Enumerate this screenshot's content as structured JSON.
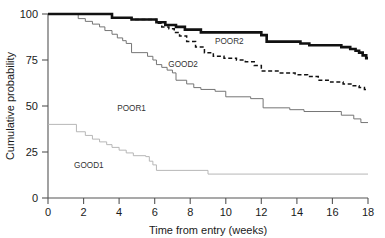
{
  "chart_data": {
    "type": "line",
    "title": "",
    "subtitle": "",
    "xlabel": "Time from entry (weeks)",
    "ylabel": "Cumulative probability",
    "xlim": [
      0,
      18
    ],
    "ylim": [
      0,
      100
    ],
    "xticks": [
      0,
      2,
      4,
      6,
      8,
      10,
      12,
      14,
      16,
      18
    ],
    "yticks": [
      0,
      25,
      50,
      75,
      100
    ],
    "xtick_labels": [
      "0",
      "2",
      "4",
      "6",
      "8",
      "10",
      "12",
      "14",
      "16",
      "18"
    ],
    "ytick_labels": [
      "0",
      "25",
      "50",
      "75",
      "100"
    ],
    "grid": false,
    "legend_position": "inline-annotations",
    "style": "kaplan-meier step curves",
    "annotations": [
      {
        "text": "POOR2",
        "x": 10.2,
        "y": 83.5
      },
      {
        "text": "GOOD2",
        "x": 7.6,
        "y": 71.0
      },
      {
        "text": "POOR1",
        "x": 4.7,
        "y": 47.5
      },
      {
        "text": "GOOD1",
        "x": 2.3,
        "y": 16.5
      }
    ],
    "series": [
      {
        "name": "POOR2",
        "style": "solid",
        "line_width": "bold",
        "color": "#111111",
        "start_value": 100,
        "end_value": 76,
        "points": [
          [
            0,
            100
          ],
          [
            3.6,
            100
          ],
          [
            3.6,
            98
          ],
          [
            4.7,
            98
          ],
          [
            4.7,
            97
          ],
          [
            6.1,
            97
          ],
          [
            6.1,
            95.5
          ],
          [
            6.6,
            95.5
          ],
          [
            6.6,
            94
          ],
          [
            7.2,
            94
          ],
          [
            7.2,
            93
          ],
          [
            7.7,
            93
          ],
          [
            7.7,
            91.5
          ],
          [
            8.6,
            91.5
          ],
          [
            8.6,
            90
          ],
          [
            12.0,
            90
          ],
          [
            12.0,
            88.5
          ],
          [
            12.3,
            88.5
          ],
          [
            12.3,
            85
          ],
          [
            14.2,
            85
          ],
          [
            14.2,
            84
          ],
          [
            14.7,
            84
          ],
          [
            14.7,
            83
          ],
          [
            16.5,
            83
          ],
          [
            16.5,
            82
          ],
          [
            17.0,
            82
          ],
          [
            17.0,
            81
          ],
          [
            17.3,
            81
          ],
          [
            17.3,
            80
          ],
          [
            17.5,
            80
          ],
          [
            17.5,
            79
          ],
          [
            17.7,
            79
          ],
          [
            17.7,
            77.5
          ],
          [
            17.9,
            77.5
          ],
          [
            17.9,
            76
          ],
          [
            18.0,
            76
          ]
        ]
      },
      {
        "name": "GOOD2",
        "style": "dotted",
        "line_width": "medium",
        "color": "#111111",
        "start_value": 100,
        "end_value": 59,
        "points": [
          [
            0,
            100
          ],
          [
            3.6,
            100
          ],
          [
            3.6,
            98
          ],
          [
            4.7,
            98
          ],
          [
            4.7,
            97
          ],
          [
            6.1,
            97
          ],
          [
            6.1,
            95
          ],
          [
            6.4,
            95
          ],
          [
            6.4,
            93
          ],
          [
            6.8,
            93
          ],
          [
            6.8,
            92
          ],
          [
            7.1,
            92
          ],
          [
            7.1,
            90
          ],
          [
            7.4,
            90
          ],
          [
            7.4,
            88
          ],
          [
            7.8,
            88
          ],
          [
            7.8,
            85
          ],
          [
            8.3,
            85
          ],
          [
            8.3,
            82
          ],
          [
            8.8,
            82
          ],
          [
            8.8,
            79
          ],
          [
            9.3,
            79
          ],
          [
            9.3,
            77
          ],
          [
            9.9,
            77
          ],
          [
            9.9,
            76
          ],
          [
            10.6,
            76
          ],
          [
            10.6,
            75
          ],
          [
            11.1,
            75
          ],
          [
            11.1,
            74
          ],
          [
            11.6,
            74
          ],
          [
            11.6,
            72
          ],
          [
            12.0,
            72
          ],
          [
            12.0,
            69
          ],
          [
            13.0,
            69
          ],
          [
            13.0,
            68
          ],
          [
            13.9,
            68
          ],
          [
            13.9,
            67
          ],
          [
            14.6,
            67
          ],
          [
            14.6,
            66
          ],
          [
            15.2,
            66
          ],
          [
            15.2,
            64
          ],
          [
            15.9,
            64
          ],
          [
            15.9,
            63
          ],
          [
            16.6,
            63
          ],
          [
            16.6,
            62
          ],
          [
            17.1,
            62
          ],
          [
            17.1,
            61
          ],
          [
            17.5,
            61
          ],
          [
            17.5,
            60
          ],
          [
            17.8,
            60
          ],
          [
            17.8,
            59
          ],
          [
            18.0,
            59
          ]
        ]
      },
      {
        "name": "POOR1",
        "style": "solid",
        "line_width": "thin",
        "color": "#6e6e6e",
        "start_value": 100,
        "end_value": 41,
        "points": [
          [
            0,
            100
          ],
          [
            1.7,
            100
          ],
          [
            1.7,
            97.5
          ],
          [
            2.1,
            97.5
          ],
          [
            2.1,
            96
          ],
          [
            2.5,
            96
          ],
          [
            2.5,
            94.5
          ],
          [
            2.9,
            94.5
          ],
          [
            2.9,
            93
          ],
          [
            3.2,
            93
          ],
          [
            3.2,
            91
          ],
          [
            3.6,
            91
          ],
          [
            3.6,
            89
          ],
          [
            3.9,
            89
          ],
          [
            3.9,
            87
          ],
          [
            4.2,
            87
          ],
          [
            4.2,
            85.5
          ],
          [
            4.4,
            85.5
          ],
          [
            4.4,
            84
          ],
          [
            4.7,
            84
          ],
          [
            4.7,
            79
          ],
          [
            5.6,
            79
          ],
          [
            5.6,
            77
          ],
          [
            5.9,
            77
          ],
          [
            5.9,
            75
          ],
          [
            6.1,
            75
          ],
          [
            6.1,
            72.5
          ],
          [
            6.4,
            72.5
          ],
          [
            6.4,
            71
          ],
          [
            6.7,
            71
          ],
          [
            6.7,
            69.5
          ],
          [
            7.0,
            69.5
          ],
          [
            7.0,
            68
          ],
          [
            7.2,
            68
          ],
          [
            7.2,
            64
          ],
          [
            7.8,
            64
          ],
          [
            7.8,
            62
          ],
          [
            8.2,
            62
          ],
          [
            8.2,
            60
          ],
          [
            8.6,
            60
          ],
          [
            8.6,
            59
          ],
          [
            9.4,
            59
          ],
          [
            9.4,
            58
          ],
          [
            10.0,
            58
          ],
          [
            10.0,
            55
          ],
          [
            11.4,
            55
          ],
          [
            11.4,
            54
          ],
          [
            12.1,
            54
          ],
          [
            12.1,
            49
          ],
          [
            13.6,
            49
          ],
          [
            13.6,
            48
          ],
          [
            14.4,
            48
          ],
          [
            14.4,
            47
          ],
          [
            16.5,
            47
          ],
          [
            16.5,
            45
          ],
          [
            17.2,
            45
          ],
          [
            17.2,
            43
          ],
          [
            17.6,
            43
          ],
          [
            17.6,
            41
          ],
          [
            18.0,
            41
          ]
        ]
      },
      {
        "name": "GOOD1",
        "style": "solid",
        "line_width": "thin",
        "color": "#b3b3b3",
        "start_value": 40,
        "end_value": 13,
        "points": [
          [
            0,
            40
          ],
          [
            1.6,
            40
          ],
          [
            1.6,
            36
          ],
          [
            2.1,
            36
          ],
          [
            2.1,
            34
          ],
          [
            2.5,
            34
          ],
          [
            2.5,
            32
          ],
          [
            2.9,
            32
          ],
          [
            2.9,
            30.5
          ],
          [
            3.3,
            30.5
          ],
          [
            3.3,
            29
          ],
          [
            3.6,
            29
          ],
          [
            3.6,
            27.5
          ],
          [
            4.0,
            27.5
          ],
          [
            4.0,
            26
          ],
          [
            4.4,
            26
          ],
          [
            4.4,
            24.5
          ],
          [
            4.8,
            24.5
          ],
          [
            4.8,
            23
          ],
          [
            5.5,
            23
          ],
          [
            5.5,
            22.5
          ],
          [
            5.7,
            22.5
          ],
          [
            5.7,
            20
          ],
          [
            5.9,
            20
          ],
          [
            5.9,
            18
          ],
          [
            6.1,
            18
          ],
          [
            6.1,
            15
          ],
          [
            9.0,
            15
          ],
          [
            9.0,
            13
          ],
          [
            18.0,
            13
          ]
        ]
      }
    ]
  },
  "axes": {
    "y_title": "Cumulative probability",
    "x_title": "Time from entry (weeks)"
  },
  "colors": {
    "poor2": "#111111",
    "good2": "#111111",
    "poor1": "#6e6e6e",
    "good1": "#b3b3b3",
    "axis": "#555555",
    "text": "#1a1a1a",
    "background": "#ffffff"
  }
}
